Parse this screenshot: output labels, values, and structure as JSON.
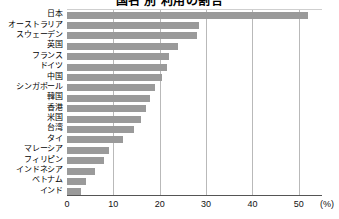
{
  "chart_data": {
    "type": "bar",
    "orientation": "horizontal",
    "title": "国名 別 利用の割合",
    "xlabel": "",
    "ylabel": "",
    "unit": "(%)",
    "xlim": [
      0,
      55
    ],
    "xticks": [
      0,
      10,
      20,
      30,
      40,
      50
    ],
    "grid": true,
    "legend": null,
    "categories": [
      "日本",
      "オーストラリア",
      "スウェーデン",
      "英国",
      "フランス",
      "ドイツ",
      "中国",
      "シンガポール",
      "韓国",
      "香港",
      "米国",
      "台湾",
      "タイ",
      "マレーシア",
      "フィリピン",
      "インドネシア",
      "ベトナム",
      "インド"
    ],
    "values": [
      52,
      28.5,
      28,
      24,
      22,
      21.5,
      20.5,
      19,
      18,
      17,
      16,
      14.5,
      12,
      9,
      8,
      6,
      4,
      3
    ],
    "series": [
      {
        "name": "割合",
        "color": "#9a9a9a",
        "values": [
          52,
          28.5,
          28,
          24,
          22,
          21.5,
          20.5,
          19,
          18,
          17,
          16,
          14.5,
          12,
          9,
          8,
          6,
          4,
          3
        ]
      }
    ]
  }
}
